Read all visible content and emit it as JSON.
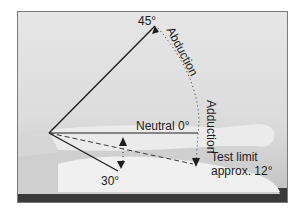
{
  "figure": {
    "labels": {
      "abduction_angle": "45°",
      "abduction": "Abduction",
      "adduction": "Adduction",
      "neutral": "Neutral 0°",
      "test_limit_line1": "Test limit",
      "test_limit_line2": "approx. 12°",
      "lower_angle": "30°"
    },
    "colors": {
      "line": "#1e1e1e",
      "background": "#dedede",
      "table": "#3a3a3a",
      "leg": "#f2f2f2"
    }
  }
}
